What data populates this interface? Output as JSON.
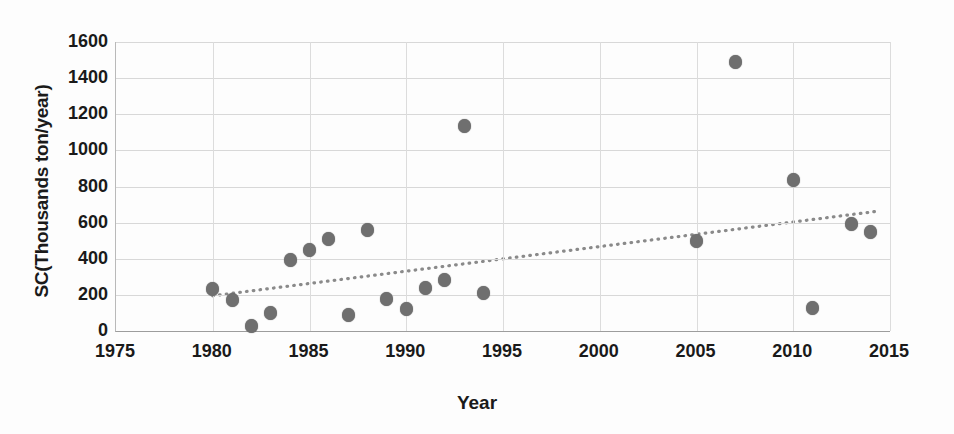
{
  "chart_data": {
    "type": "scatter",
    "title": "",
    "xlabel": "Year",
    "ylabel": "SC(Thousands ton/year)",
    "xlim": [
      1975,
      2015
    ],
    "ylim": [
      0,
      1600
    ],
    "xticks": [
      1975,
      1980,
      1985,
      1990,
      1995,
      2000,
      2005,
      2010,
      2015
    ],
    "yticks": [
      0,
      200,
      400,
      600,
      800,
      1000,
      1200,
      1400,
      1600
    ],
    "grid": true,
    "legend": "none",
    "series": [
      {
        "name": "SC",
        "marker": "filled-circle",
        "color": "#6f6f6f",
        "points": [
          {
            "x": 1980,
            "y": 230
          },
          {
            "x": 1981,
            "y": 170
          },
          {
            "x": 1982,
            "y": 30
          },
          {
            "x": 1983,
            "y": 100
          },
          {
            "x": 1984,
            "y": 395
          },
          {
            "x": 1985,
            "y": 450
          },
          {
            "x": 1986,
            "y": 510
          },
          {
            "x": 1987,
            "y": 90
          },
          {
            "x": 1988,
            "y": 560
          },
          {
            "x": 1989,
            "y": 175
          },
          {
            "x": 1990,
            "y": 120
          },
          {
            "x": 1991,
            "y": 240
          },
          {
            "x": 1992,
            "y": 285
          },
          {
            "x": 1993,
            "y": 1135
          },
          {
            "x": 1994,
            "y": 210
          },
          {
            "x": 2005,
            "y": 500
          },
          {
            "x": 2007,
            "y": 1490
          },
          {
            "x": 2010,
            "y": 835
          },
          {
            "x": 2011,
            "y": 130
          },
          {
            "x": 2013,
            "y": 595
          },
          {
            "x": 2014,
            "y": 550
          }
        ]
      }
    ],
    "trendline": {
      "name": "linear-trend",
      "style": "dotted",
      "color": "#8a8a8a",
      "x_start": 1980,
      "y_start": 195,
      "x_end": 2014.5,
      "y_end": 665
    }
  }
}
